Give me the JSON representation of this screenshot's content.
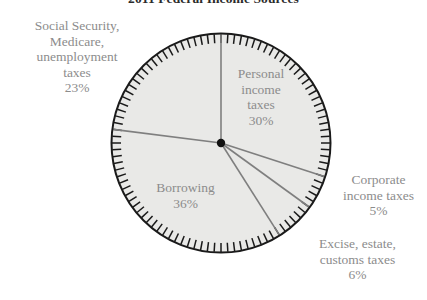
{
  "chart_data": {
    "type": "pie",
    "title": "2011 Federal Income Sources",
    "xlabel": "",
    "ylabel": "",
    "legend_position": "none",
    "grid": false,
    "start_angle_deg": 90,
    "direction": "clockwise",
    "units": "percent",
    "categories": [
      "Personal income taxes",
      "Corporate income taxes",
      "Excise, estate, customs taxes",
      "Borrowing",
      "Social Security, Medicare, unemployment taxes"
    ],
    "values": [
      30,
      5,
      6,
      36,
      23
    ],
    "slices": [
      {
        "id": "personal",
        "name": "Personal income taxes",
        "value": 30,
        "value_label": "30%",
        "label_lines": [
          "Personal",
          "income",
          "taxes"
        ],
        "label_placement": "inside",
        "start_deg": 0,
        "sweep_deg": 108
      },
      {
        "id": "corporate",
        "name": "Corporate income taxes",
        "value": 5,
        "value_label": "5%",
        "label_lines": [
          "Corporate",
          "income taxes"
        ],
        "label_placement": "outside-right",
        "start_deg": 108,
        "sweep_deg": 18
      },
      {
        "id": "excise",
        "name": "Excise, estate, customs taxes",
        "value": 6,
        "value_label": "6%",
        "label_lines": [
          "Excise, estate,",
          "customs taxes"
        ],
        "label_placement": "outside-bottom-right",
        "start_deg": 126,
        "sweep_deg": 21.6
      },
      {
        "id": "borrowing",
        "name": "Borrowing",
        "value": 36,
        "value_label": "36%",
        "label_lines": [
          "Borrowing"
        ],
        "label_placement": "inside",
        "start_deg": 147.6,
        "sweep_deg": 129.6
      },
      {
        "id": "social-security",
        "name": "Social Security, Medicare, unemployment taxes",
        "value": 23,
        "value_label": "23%",
        "label_lines": [
          "Social Security,",
          "Medicare,",
          "unemployment",
          "taxes"
        ],
        "label_placement": "outside-left",
        "start_deg": 277.2,
        "sweep_deg": 82.8
      }
    ],
    "colors": {
      "slice_fill": "#e9e9e7",
      "rim_stroke": "#1a1a1a",
      "divider_stroke": "#7f7f7f",
      "center_dot": "#111111",
      "label_text": "#8c8c8c",
      "title_text": "#2b2b2b",
      "background": "#ffffff"
    },
    "rim_ticks": {
      "count": 100,
      "description": "radial tick marks around the circumference"
    }
  }
}
